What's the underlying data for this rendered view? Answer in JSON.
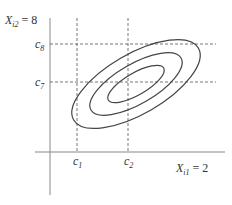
{
  "diagram": {
    "type": "bivariate-contour-ellipses",
    "y_axis_label": {
      "var": "X",
      "sub": "i2",
      "eq": " = 8"
    },
    "x_axis_label": {
      "var": "X",
      "sub": "i1",
      "eq": " = 2"
    },
    "x_ticks": [
      {
        "var": "c",
        "sub": "1"
      },
      {
        "var": "c",
        "sub": "2"
      }
    ],
    "y_ticks": [
      {
        "var": "c",
        "sub": "8"
      },
      {
        "var": "c",
        "sub": "7"
      }
    ],
    "contours": 3,
    "colors": {
      "axis": "#777777",
      "curve": "#444444",
      "dashed": "#666666"
    }
  }
}
